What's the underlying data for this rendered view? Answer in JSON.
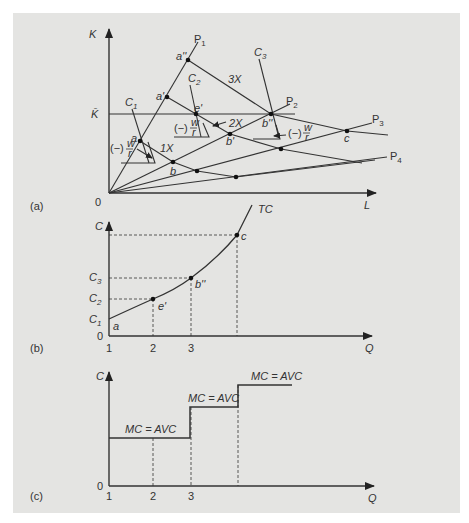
{
  "figure": {
    "background": "#e4e4e2",
    "line_color": "#333333"
  },
  "panel_a": {
    "tag": "(a)",
    "y_axis_label": "K",
    "x_axis_label": "L",
    "origin_label": "0",
    "k_bar_label": "K̄",
    "rays": [
      "P1",
      "P2",
      "P3",
      "P4"
    ],
    "isocost_labels": [
      "C1",
      "C2",
      "C3"
    ],
    "isoquant_labels": [
      "1X",
      "2X",
      "3X"
    ],
    "points": [
      "a",
      "a'",
      "a''",
      "e'",
      "b",
      "b'",
      "b''",
      "c"
    ],
    "slope_label": "(−) w/r",
    "slope_num": "w",
    "slope_den": "r",
    "slope_prefix": "(−)"
  },
  "panel_b": {
    "tag": "(b)",
    "y_axis_label": "C",
    "x_axis_label": "Q",
    "origin_label": "0",
    "curve_label": "TC",
    "y_ticks": [
      "C1",
      "C2",
      "C3"
    ],
    "x_ticks": [
      "1",
      "2",
      "3"
    ],
    "points": [
      "a",
      "e'",
      "b''",
      "c"
    ]
  },
  "panel_c": {
    "tag": "(c)",
    "y_axis_label": "C",
    "x_axis_label": "Q",
    "origin_label": "0",
    "x_ticks": [
      "1",
      "2",
      "3"
    ],
    "step_labels": [
      "MC = AVC",
      "MC = AVC",
      "MC = AVC"
    ]
  }
}
